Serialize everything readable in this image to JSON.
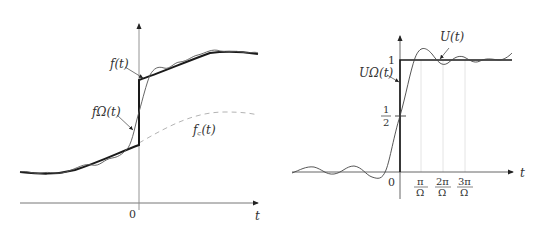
{
  "left_figure": {
    "labels": {
      "f": "f(t)",
      "f_omega": "fΩ(t)",
      "f_c": "f꜀(t)",
      "origin": "0",
      "x_axis": "t"
    }
  },
  "right_figure": {
    "labels": {
      "U": "U(t)",
      "U_omega": "UΩ(t)",
      "one": "1",
      "half_num": "1",
      "half_den": "2",
      "origin": "0",
      "x_axis": "t",
      "tick1_num": "π",
      "tick2_num": "2π",
      "tick3_num": "3π",
      "tick_den": "Ω"
    }
  },
  "colors": {
    "axis": "#555555",
    "thick": "#1a1a1a",
    "thin": "#444444",
    "dashed": "#999999",
    "grid": "#d8d8d8"
  }
}
